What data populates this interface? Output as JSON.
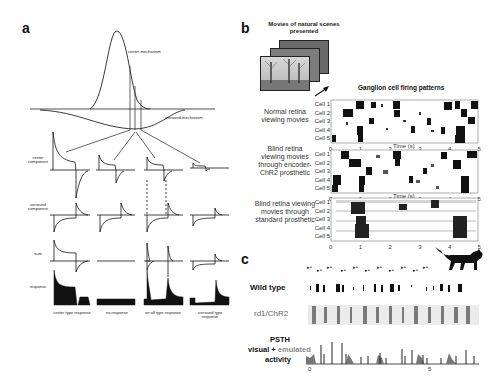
{
  "figure": {
    "panel_a": {
      "letter": "a",
      "curve_labels": {
        "center": "center-mechanism",
        "surround": "surround-mechanism"
      },
      "row_labels": [
        "center component",
        "surround component",
        "sum",
        "response"
      ],
      "column_labels": [
        "center type response",
        "no response",
        "on off type response",
        "surround type response"
      ]
    },
    "panel_b": {
      "letter": "b",
      "stimulus_label": "Movies of natural scenes presented",
      "raster_title": "Ganglion cell firing patterns",
      "rows": [
        {
          "label": "Normal retina viewing movies"
        },
        {
          "label": "Blind retina viewing movies through encoder-ChR2 prosthetic"
        },
        {
          "label": "Blind retina viewing movies through standard prosthetic"
        }
      ],
      "cell_labels": [
        "Cell 1",
        "Cell 2",
        "Cell 3",
        "Cell 4",
        "Cell 5"
      ],
      "x_ticks": [
        "0",
        "1",
        "2",
        "3",
        "4",
        "5"
      ],
      "x_label": "Time (s)"
    },
    "panel_c": {
      "letter": "c",
      "rows": [
        "Wild type",
        "rd1/ChR2"
      ],
      "psth_label_line1": "PSTH",
      "psth_label_line2a": "visual + ",
      "psth_label_line2b": "emulated",
      "psth_label_line3": "activity",
      "x_ticks": [
        "0",
        "5"
      ],
      "accent_gray": "#8a8a8a"
    }
  }
}
